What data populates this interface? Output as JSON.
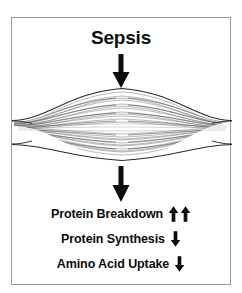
{
  "figure": {
    "title": "Sepsis",
    "frame_color": "#9a9a9a",
    "background_color": "#ffffff",
    "ink_color": "#0d0d0d",
    "muscle_label": "skeletal-muscle-illustration"
  },
  "flow": {
    "arrow_top": "down-arrow",
    "arrow_bottom": "down-arrow"
  },
  "effects": [
    {
      "label": "Protein Breakdown",
      "direction": "up",
      "arrow_count": 2,
      "icon": "up-arrow-icon"
    },
    {
      "label": "Protein Synthesis",
      "direction": "down",
      "arrow_count": 1,
      "icon": "down-arrow-icon"
    },
    {
      "label": "Amino Acid Uptake",
      "direction": "down",
      "arrow_count": 1,
      "icon": "down-arrow-icon"
    }
  ]
}
